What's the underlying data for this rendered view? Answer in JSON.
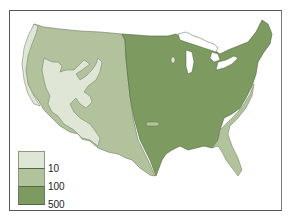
{
  "map": {
    "subject": "contiguous-united-states",
    "regions": [
      {
        "name": "low",
        "color": "#dfe6d6"
      },
      {
        "name": "medium",
        "color": "#b2c29d"
      },
      {
        "name": "high",
        "color": "#7d9a60"
      },
      {
        "name": "water",
        "color": "#ffffff"
      }
    ]
  },
  "legend": {
    "items": [
      {
        "color": "#dfe6d6",
        "label": ""
      },
      {
        "color": "#b2c29d",
        "label": "10"
      },
      {
        "color": "#7d9a60",
        "label": "100"
      }
    ],
    "labels": [
      "10",
      "100",
      "500"
    ]
  }
}
